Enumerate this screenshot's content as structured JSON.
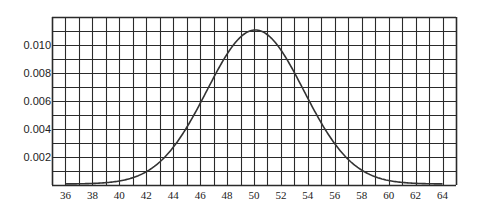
{
  "chart_data": {
    "type": "line",
    "title": "",
    "xlabel": "",
    "ylabel": "",
    "xlim": [
      35,
      65
    ],
    "ylim": [
      0,
      0.012
    ],
    "grid": true,
    "grid_x_step": 1,
    "grid_y_step": 0.001,
    "x_ticks": [
      36,
      38,
      40,
      42,
      44,
      46,
      48,
      50,
      52,
      54,
      56,
      58,
      60,
      62,
      64
    ],
    "x_tick_labels": [
      "36",
      "38",
      "40",
      "42",
      "44",
      "46",
      "48",
      "50",
      "52",
      "54",
      "56",
      "58",
      "60",
      "62",
      "64"
    ],
    "y_ticks": [
      0.002,
      0.004,
      0.006,
      0.008,
      0.01
    ],
    "y_tick_labels": [
      "0.002",
      "0.004",
      "0.006",
      "0.008",
      "0.010"
    ],
    "series": [
      {
        "name": "normal density curve",
        "distribution": {
          "mean": 50.1,
          "peak": 0.011,
          "sd": 3.6
        },
        "x": [
          36,
          38,
          40,
          42,
          44,
          46,
          48,
          50,
          52,
          54,
          56,
          58,
          60,
          62,
          64
        ],
        "values": [
          0.0,
          0.0002,
          0.0004,
          0.0009,
          0.0026,
          0.0057,
          0.0093,
          0.011,
          0.0095,
          0.0061,
          0.0029,
          0.001,
          0.0003,
          0.0001,
          0.0
        ]
      }
    ],
    "legend": null
  },
  "colors": {
    "grid": "#2a2a2a",
    "curve": "#333333",
    "background": "#ffffff"
  }
}
